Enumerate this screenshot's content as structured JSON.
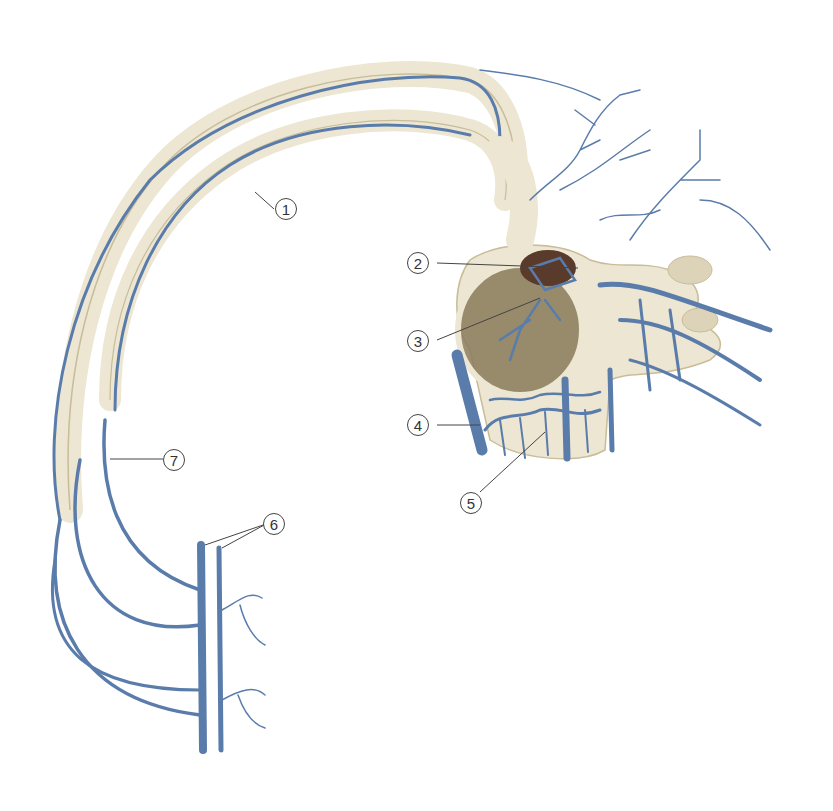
{
  "figure": {
    "type": "anatomical-illustration",
    "colors": {
      "vein": "#5a7cab",
      "vein_light": "#9bb3d4",
      "bone": "#ece6d2",
      "bone_shade": "#c8bd98",
      "spongy": "#8a7a5a",
      "leader": "#444444"
    }
  },
  "callouts": [
    {
      "number": "1",
      "x": 285,
      "y": 198,
      "target": [
        255,
        192
      ]
    },
    {
      "number": "2",
      "x": 415,
      "y": 252,
      "target": [
        578,
        268
      ]
    },
    {
      "number": "3",
      "x": 415,
      "y": 330,
      "target": [
        540,
        298
      ]
    },
    {
      "number": "4",
      "x": 415,
      "y": 414,
      "target": [
        480,
        425
      ]
    },
    {
      "number": "5",
      "x": 465,
      "y": 492,
      "target": [
        545,
        432
      ]
    },
    {
      "number": "6",
      "x": 266,
      "y": 513,
      "target": [
        205,
        545
      ]
    },
    {
      "number": "7",
      "x": 174,
      "y": 449,
      "target": [
        110,
        459
      ]
    }
  ]
}
